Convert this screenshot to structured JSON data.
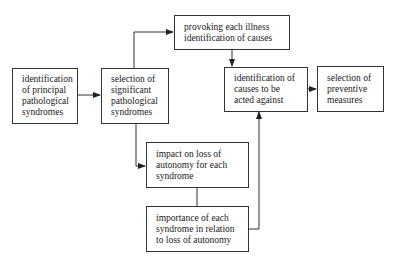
{
  "diagram": {
    "type": "flowchart",
    "nodes": [
      {
        "id": "A",
        "label": "identification\nof principal\npathological\nsyndromes"
      },
      {
        "id": "B",
        "label": "selection of\nsignificant\npathological\nsyndromes"
      },
      {
        "id": "C",
        "label": "provoking each illness\nidentification of causes"
      },
      {
        "id": "D",
        "label": "identification of\ncauses to be\nacted against"
      },
      {
        "id": "E",
        "label": "selection of\npreventive\nmeasures"
      },
      {
        "id": "F",
        "label": "impact on loss of\nautonomy for each\nsyndrome"
      },
      {
        "id": "G",
        "label": "importance of each\nsyndrome in relation\nto loss of autonomy"
      }
    ],
    "edges": [
      {
        "from": "A",
        "to": "B",
        "arrow": true
      },
      {
        "from": "B",
        "to": "C",
        "arrow": true
      },
      {
        "from": "C",
        "to": "D",
        "arrow": true
      },
      {
        "from": "D",
        "to": "E",
        "arrow": true
      },
      {
        "from": "B",
        "to": "F",
        "arrow": true
      },
      {
        "from": "F",
        "to": "G",
        "arrow": false
      },
      {
        "from": "G",
        "to": "D",
        "arrow": true
      }
    ],
    "colors": {
      "line": "#333333",
      "background": "#ffffff",
      "text": "#1a1a1a"
    }
  }
}
